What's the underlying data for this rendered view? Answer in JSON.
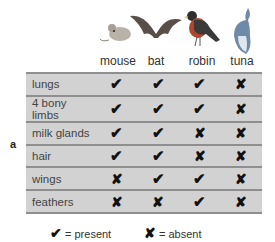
{
  "figure_label": "a",
  "columns": [
    {
      "name": "mouse",
      "icon": "mouse-icon"
    },
    {
      "name": "bat",
      "icon": "bat-icon"
    },
    {
      "name": "robin",
      "icon": "robin-icon"
    },
    {
      "name": "tuna",
      "icon": "tuna-icon"
    }
  ],
  "symbols": {
    "present": "✔",
    "absent": "✘"
  },
  "rows": [
    {
      "trait": "lungs",
      "values": [
        "present",
        "present",
        "present",
        "absent"
      ]
    },
    {
      "trait": "4 bony limbs",
      "values": [
        "present",
        "present",
        "present",
        "absent"
      ]
    },
    {
      "trait": "milk glands",
      "values": [
        "present",
        "present",
        "absent",
        "absent"
      ]
    },
    {
      "trait": "hair",
      "values": [
        "present",
        "present",
        "absent",
        "absent"
      ]
    },
    {
      "trait": "wings",
      "values": [
        "absent",
        "present",
        "present",
        "absent"
      ]
    },
    {
      "trait": "feathers",
      "values": [
        "absent",
        "absent",
        "present",
        "absent"
      ]
    }
  ],
  "legend": {
    "present_symbol": "✔",
    "present_label": "= present",
    "absent_symbol": "✘",
    "absent_label": "= absent"
  },
  "colors": {
    "table_bg": "#d2d2d2",
    "row_line": "#8f8f8f",
    "mark": "#111111"
  }
}
